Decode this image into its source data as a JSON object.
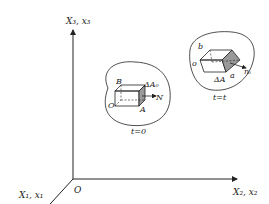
{
  "axes": {
    "x3_label": "X₃, x₃",
    "x2_label": "X₂, x₂",
    "x1_label": "X₁, x₁",
    "origin_label": "O"
  },
  "reference_config": {
    "corner_O": "O",
    "corner_A": "A",
    "corner_B": "B",
    "area_label": "ΔA₀",
    "normal_label": "N",
    "time_label": "t=0"
  },
  "current_config": {
    "corner_o": "o",
    "corner_a": "a",
    "corner_b": "b",
    "area_label": "ΔA",
    "normal_label": "nᵢ",
    "time_label": "t=t"
  }
}
